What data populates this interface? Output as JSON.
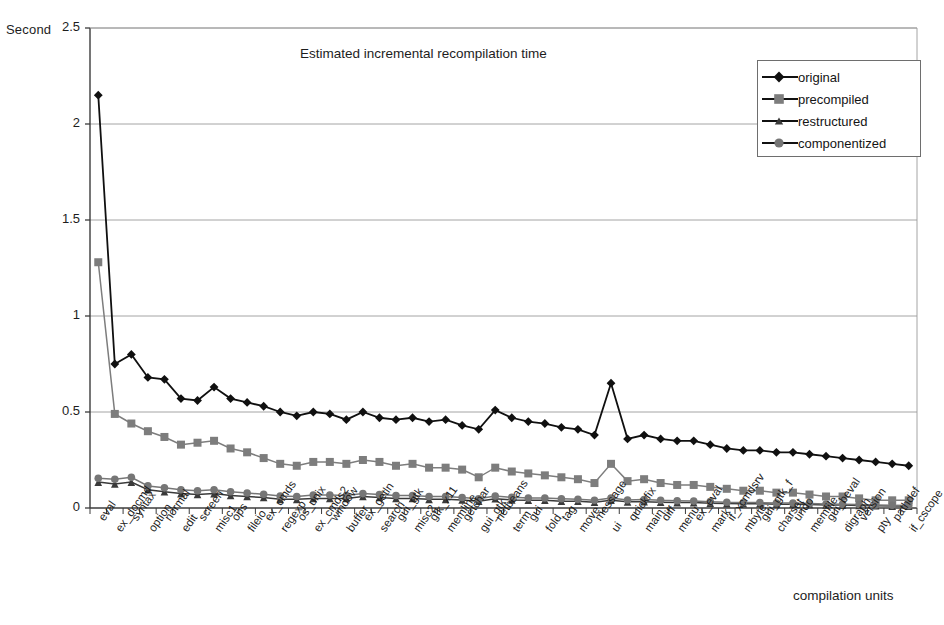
{
  "chart_data": {
    "type": "line",
    "title": "Estimated incremental recompilation time",
    "xlabel": "compilation units",
    "ylabel": "Second",
    "ylim": [
      0,
      2.5
    ],
    "yticks": [
      0,
      0.5,
      1,
      1.5,
      2,
      2.5
    ],
    "ytick_labels": [
      "0",
      "0.5",
      "1",
      "1.5",
      "2",
      "2.5"
    ],
    "grid": true,
    "grid_axis": "y",
    "legend_position": "top-right",
    "categories": [
      "eval",
      "ex_docmd",
      "syntax",
      "option",
      "normal",
      "edit",
      "screen",
      "misc1",
      "ops",
      "fileio",
      "ex_cmds",
      "regexp",
      "os_unix",
      "ex_cmds2",
      "window",
      "buffer",
      "ex_getln",
      "search",
      "gui_gtk",
      "misc2",
      "gtk_x11",
      "memline",
      "getchar",
      "gui_gtk",
      "netbeans",
      "term",
      "gui",
      "fold",
      "tag",
      "move",
      "message",
      "ui",
      "quickfix",
      "main",
      "diff",
      "menu",
      "ex_eval",
      "mark",
      "if_xcmdsrv",
      "mbyte",
      "gui_gtk_f",
      "charset",
      "undo",
      "memfile",
      "gui_beval",
      "digraph",
      "version",
      "pty",
      "pathdef",
      "if_cscope"
    ],
    "series": [
      {
        "name": "original",
        "color": "#101010",
        "marker": "diamond",
        "values": [
          2.15,
          0.75,
          0.8,
          0.68,
          0.67,
          0.57,
          0.56,
          0.63,
          0.57,
          0.55,
          0.53,
          0.5,
          0.48,
          0.5,
          0.49,
          0.46,
          0.5,
          0.47,
          0.46,
          0.47,
          0.45,
          0.46,
          0.43,
          0.41,
          0.51,
          0.47,
          0.45,
          0.44,
          0.42,
          0.41,
          0.38,
          0.65,
          0.36,
          0.38,
          0.36,
          0.35,
          0.35,
          0.33,
          0.31,
          0.3,
          0.3,
          0.29,
          0.29,
          0.28,
          0.27,
          0.26,
          0.25,
          0.24,
          0.23,
          0.22
        ]
      },
      {
        "name": "precompiled",
        "color": "#7d7d7d",
        "marker": "square",
        "values": [
          1.28,
          0.49,
          0.44,
          0.4,
          0.37,
          0.33,
          0.34,
          0.35,
          0.31,
          0.29,
          0.26,
          0.23,
          0.22,
          0.24,
          0.24,
          0.23,
          0.25,
          0.24,
          0.22,
          0.23,
          0.21,
          0.21,
          0.2,
          0.16,
          0.21,
          0.19,
          0.18,
          0.17,
          0.16,
          0.15,
          0.13,
          0.23,
          0.14,
          0.15,
          0.13,
          0.12,
          0.12,
          0.11,
          0.1,
          0.09,
          0.09,
          0.08,
          0.08,
          0.07,
          0.06,
          0.06,
          0.05,
          0.04,
          0.04,
          0.04
        ]
      },
      {
        "name": "restructured",
        "color": "#3a3a3a",
        "marker": "triangle",
        "values": [
          0.135,
          0.125,
          0.135,
          0.095,
          0.085,
          0.075,
          0.07,
          0.075,
          0.065,
          0.06,
          0.055,
          0.045,
          0.045,
          0.05,
          0.05,
          0.05,
          0.06,
          0.055,
          0.05,
          0.05,
          0.045,
          0.045,
          0.042,
          0.035,
          0.048,
          0.042,
          0.04,
          0.04,
          0.035,
          0.035,
          0.03,
          0.04,
          0.032,
          0.033,
          0.03,
          0.028,
          0.028,
          0.025,
          0.023,
          0.022,
          0.022,
          0.02,
          0.02,
          0.018,
          0.016,
          0.015,
          0.013,
          0.012,
          0.01,
          0.01
        ]
      },
      {
        "name": "componentized",
        "color": "#767676",
        "marker": "circle",
        "values": [
          0.155,
          0.15,
          0.16,
          0.115,
          0.105,
          0.095,
          0.09,
          0.095,
          0.085,
          0.078,
          0.072,
          0.062,
          0.06,
          0.068,
          0.068,
          0.065,
          0.075,
          0.07,
          0.065,
          0.065,
          0.06,
          0.06,
          0.055,
          0.048,
          0.062,
          0.056,
          0.052,
          0.052,
          0.048,
          0.045,
          0.04,
          0.052,
          0.042,
          0.044,
          0.04,
          0.038,
          0.036,
          0.033,
          0.03,
          0.029,
          0.028,
          0.026,
          0.026,
          0.023,
          0.021,
          0.02,
          0.018,
          0.016,
          0.014,
          0.013
        ]
      }
    ]
  },
  "legend": {
    "items": [
      {
        "label": "original"
      },
      {
        "label": "precompiled"
      },
      {
        "label": "restructured"
      },
      {
        "label": "componentized"
      }
    ]
  },
  "axes": {
    "y_title": "Second",
    "x_title": "compilation units"
  },
  "colors": {
    "original": "#101010",
    "precompiled": "#7d7d7d",
    "restructured": "#3a3a3a",
    "componentized": "#767676",
    "grid": "#9a9a9a",
    "axis": "#3c3c3c",
    "background": "#ffffff"
  }
}
